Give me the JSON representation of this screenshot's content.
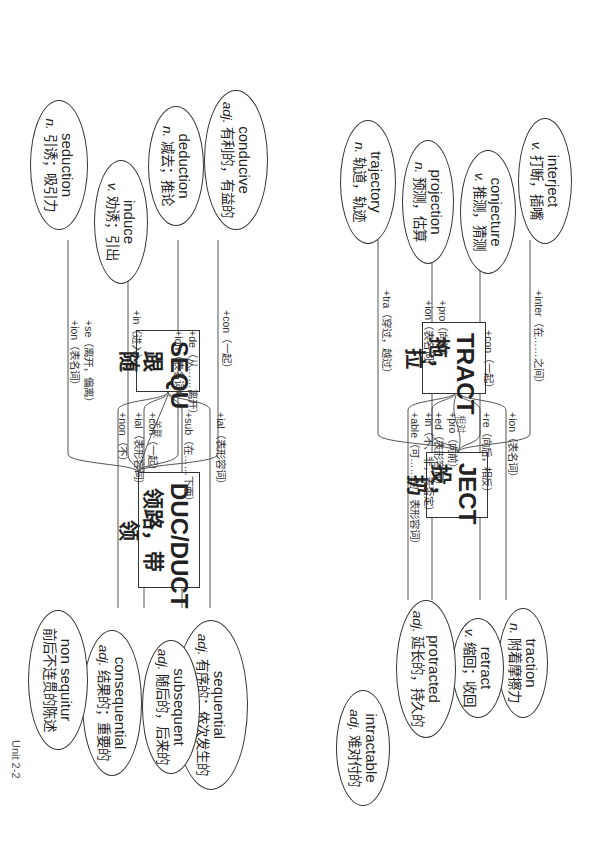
{
  "page_label": "Unit 2-2",
  "connectors": [
    {
      "from": "TRACT",
      "to": "JECT",
      "label": "相对"
    },
    {
      "from": "SEQU",
      "to": "DUC/DUCT",
      "label": "关联"
    }
  ],
  "groups": [
    {
      "root": {
        "title": "TRACT",
        "meaning": "拖，拉"
      },
      "branches": [
        {
          "affix": [
            "+ion（表名词）"
          ],
          "word": "traction",
          "pos": "n.",
          "meaning": "附着摩擦力"
        },
        {
          "affix": [
            "+re（向后，相反）"
          ],
          "word": "retract",
          "pos": "v.",
          "meaning": "缩回；收回"
        },
        {
          "affix": [
            "+pro（向前）",
            "+ed（表形容词）"
          ],
          "word": "protracted",
          "pos": "adj.",
          "meaning": "延长的，持久的"
        },
        {
          "affix": [
            "+in（不、非，表否定）",
            "+able（可……的，表形容词）"
          ],
          "word": "intractable",
          "pos": "adj.",
          "meaning": "难对付的"
        }
      ]
    },
    {
      "root": {
        "title": "SEQU",
        "meaning": "跟随"
      },
      "branches": [
        {
          "affix": [
            "+ial（表形容词）"
          ],
          "word": "sequential",
          "pos": "adj.",
          "meaning": "有序的；依次发生的"
        },
        {
          "affix": [
            "+sub（在……下面）"
          ],
          "word": "subsequent",
          "pos": "adj.",
          "meaning": "随后的，后来的"
        },
        {
          "affix": [
            "+con（一起）",
            "+ial（表形容词）"
          ],
          "word": "consequential",
          "pos": "adj.",
          "meaning": "结果的；重要的"
        },
        {
          "affix": [
            "+non（不）"
          ],
          "word": "non sequitur",
          "pos": "",
          "meaning": "前后不连贯的陈述"
        }
      ]
    },
    {
      "root": {
        "title": "JECT",
        "meaning": "投，扔"
      },
      "branches": [
        {
          "affix": [
            "+inter（在……之间）"
          ],
          "word": "interject",
          "pos": "v.",
          "meaning": "打断，插嘴"
        },
        {
          "affix": [
            "+con（一起）"
          ],
          "word": "conjecture",
          "pos": "v.",
          "meaning": "推测，猜测"
        },
        {
          "affix": [
            "+pro（向前）",
            "+ion（表名词）"
          ],
          "word": "projection",
          "pos": "n.",
          "meaning": "预测，估算"
        },
        {
          "affix": [
            "+tra（穿过，越过）"
          ],
          "word": "trajectory",
          "pos": "n.",
          "meaning": "轨道，轨迹"
        }
      ]
    },
    {
      "root": {
        "title": "DUC/DUCT",
        "meaning": "领路，带领"
      },
      "branches": [
        {
          "affix": [
            "+con（一起）"
          ],
          "word": "conducive",
          "pos": "adj.",
          "meaning": "有利的，有益的"
        },
        {
          "affix": [
            "+de（从……离开）",
            "+ion（表名词）"
          ],
          "word": "deduction",
          "pos": "n.",
          "meaning": "减去；推论"
        },
        {
          "affix": [
            "+in（进入）"
          ],
          "word": "induce",
          "pos": "v.",
          "meaning": "劝诱；引出"
        },
        {
          "affix": [
            "+se（离开，偏离）",
            "+ion（表名词）"
          ],
          "word": "seduction",
          "pos": "n.",
          "meaning": "引诱；吸引力"
        }
      ]
    }
  ]
}
